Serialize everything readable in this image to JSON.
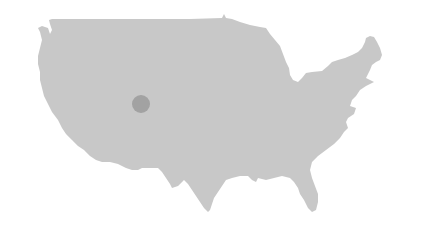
{
  "map": {
    "region": "Contiguous United States",
    "colors": {
      "background": "#ffffff",
      "land": "#c8c8c8",
      "marker": "#a2a2a2"
    },
    "markers": [
      {
        "label": "location-marker",
        "cx": 141,
        "cy": 104,
        "r": 9
      }
    ]
  }
}
